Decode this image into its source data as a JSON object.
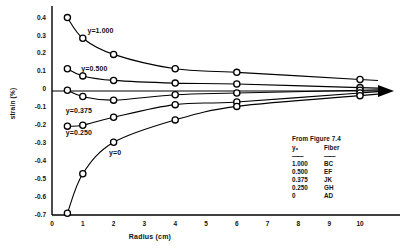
{
  "chart_data": {
    "type": "line",
    "title": "",
    "xlabel": "Radius (cm)",
    "ylabel": "strain (%)",
    "xlim": [
      0,
      10.8
    ],
    "ylim": [
      -0.7,
      0.45
    ],
    "xticks": [
      "0",
      "1",
      "2",
      "3",
      "4",
      "5",
      "6",
      "7",
      "8",
      "9",
      "10"
    ],
    "xtick_values": [
      0,
      1,
      2,
      3,
      4,
      5,
      6,
      7,
      8,
      9,
      10
    ],
    "yticks": [
      "0.4",
      "0.3",
      "0.2",
      "0.1",
      "0",
      "-0.1",
      "-0.2",
      "-0.3",
      "-0.4",
      "-0.5",
      "-0.6",
      "-0.7"
    ],
    "ytick_values": [
      0.4,
      0.3,
      0.2,
      0.1,
      0,
      -0.1,
      -0.2,
      -0.3,
      -0.4,
      -0.5,
      -0.6,
      -0.7
    ],
    "grid": false,
    "legend_position": "lower-right",
    "marker": "circle-open",
    "zero_line": true,
    "zero_line_arrow": true,
    "x": [
      0.5,
      1,
      2,
      4,
      6,
      10
    ],
    "series": [
      {
        "name": "y=1.000",
        "label": "y=1.000",
        "values": [
          0.4,
          0.285,
          0.195,
          0.115,
          0.095,
          0.055
        ]
      },
      {
        "name": "y=0.500",
        "label": "y=0.500",
        "values": [
          0.115,
          0.075,
          0.05,
          0.035,
          0.03,
          0.01
        ]
      },
      {
        "name": "y=0.375",
        "label": "y=0.375",
        "values": [
          -0.005,
          -0.04,
          -0.06,
          -0.03,
          -0.02,
          -0.005
        ]
      },
      {
        "name": "y=0.250",
        "label": "y=0.250",
        "values": [
          -0.205,
          -0.2,
          -0.155,
          -0.085,
          -0.07,
          -0.02
        ]
      },
      {
        "name": "y=0",
        "label": "y=0",
        "values": [
          -0.69,
          -0.47,
          -0.295,
          -0.17,
          -0.095,
          -0.035
        ]
      }
    ],
    "curve_labels": [
      {
        "text": "y=1.000",
        "x": 1.15,
        "y": 0.325
      },
      {
        "text": "y=0.500",
        "x": 0.95,
        "y": 0.112
      },
      {
        "text": "y=0.375",
        "x": 0.45,
        "y": -0.118
      },
      {
        "text": "y=0.250",
        "x": 0.45,
        "y": -0.242
      },
      {
        "text": "y=0",
        "x": 1.85,
        "y": -0.355
      }
    ]
  },
  "legend": {
    "title": "From Figure 7.4",
    "columns": [
      "y₀",
      "Fiber"
    ],
    "rows": [
      {
        "y0": "1.000",
        "fiber": "BC"
      },
      {
        "y0": "0.500",
        "fiber": "EF"
      },
      {
        "y0": "0.375",
        "fiber": "JK"
      },
      {
        "y0": "0.250",
        "fiber": "GH"
      },
      {
        "y0": "0",
        "fiber": "AD"
      }
    ]
  },
  "style": {
    "ink": "#000000",
    "paper": "#ffffff"
  }
}
